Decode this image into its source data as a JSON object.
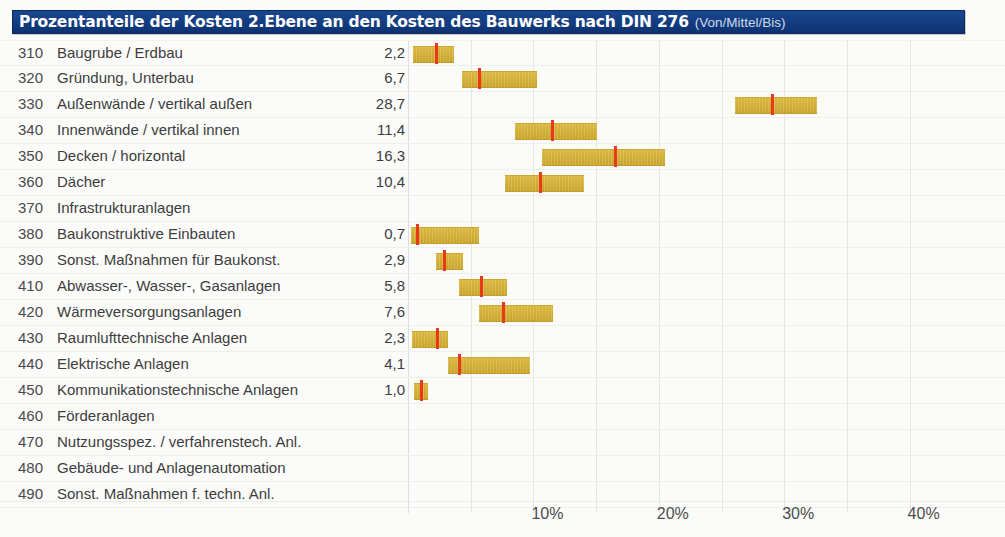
{
  "header": {
    "title_main": "Prozentanteile der Kosten 2.Ebene an den Kosten des Bauwerks nach DIN 276",
    "title_sub": "(Von/Mittel/Bis)"
  },
  "colors": {
    "header_bg": "#123c80",
    "bar": "#d2ae34",
    "marker": "#e8391b",
    "grid": "#e6e6e4"
  },
  "chart_data": {
    "type": "bar",
    "title": "Prozentanteile der Kosten 2.Ebene an den Kosten des Bauwerks nach DIN 276 (Von/Mittel/Bis)",
    "xlabel": "",
    "ylabel": "",
    "xlim": [
      0,
      42
    ],
    "grid": true,
    "legend": "none",
    "xticks": [
      "10%",
      "20%",
      "30%",
      "40%"
    ],
    "xtick_values": [
      10,
      20,
      30,
      40
    ],
    "value_format": "von / mittel / bis (Prozent)",
    "categories": [
      "310 Baugrube / Erdbau",
      "320 Gründung, Unterbau",
      "330 Außenwände / vertikal außen",
      "340 Innenwände / vertikal innen",
      "350 Decken / horizontal",
      "360 Dächer",
      "370 Infrastrukturanlagen",
      "380 Baukonstruktive Einbauten",
      "390 Sonst. Maßnahmen für Baukonst.",
      "410 Abwasser-, Wasser-, Gasanlagen",
      "420 Wärmeversorgungsanlagen",
      "430 Raumlufttechnische Anlagen",
      "440 Elektrische Anlagen",
      "450 Kommunikationstechnische Anlagen",
      "460 Förderanlagen",
      "470 Nutzungsspez. / verfahrenstech. Anl.",
      "480 Gebäude- und Anlagenautomation",
      "490 Sonst. Maßnahmen f. techn. Anl."
    ],
    "rows": [
      {
        "code": "310",
        "label": "Baugrube / Erdbau",
        "value": "2,2",
        "von": 0.4,
        "mittel": 2.2,
        "bis": 3.7
      },
      {
        "code": "320",
        "label": "Gründung, Unterbau",
        "value": "6,7",
        "von": 4.3,
        "mittel": 5.7,
        "bis": 10.3
      },
      {
        "code": "330",
        "label": "Außenwände / vertikal außen",
        "value": "28,7",
        "von": 26.1,
        "mittel": 29.0,
        "bis": 32.6
      },
      {
        "code": "340",
        "label": "Innenwände / vertikal innen",
        "value": "11,4",
        "von": 8.5,
        "mittel": 11.5,
        "bis": 15.1
      },
      {
        "code": "350",
        "label": "Decken / horizontal",
        "value": "16,3",
        "von": 10.7,
        "mittel": 16.5,
        "bis": 20.5
      },
      {
        "code": "360",
        "label": "Dächer",
        "value": "10,4",
        "von": 7.7,
        "mittel": 10.5,
        "bis": 14.0
      },
      {
        "code": "370",
        "label": "Infrastrukturanlagen",
        "value": "",
        "von": null,
        "mittel": null,
        "bis": null
      },
      {
        "code": "380",
        "label": "Baukonstruktive Einbauten",
        "value": "0,7",
        "von": 0.2,
        "mittel": 0.7,
        "bis": 5.7
      },
      {
        "code": "390",
        "label": "Sonst. Maßnahmen für Baukonst.",
        "value": "2,9",
        "von": 2.2,
        "mittel": 2.9,
        "bis": 4.4
      },
      {
        "code": "410",
        "label": "Abwasser-, Wasser-, Gasanlagen",
        "value": "5,8",
        "von": 4.1,
        "mittel": 5.8,
        "bis": 7.9
      },
      {
        "code": "420",
        "label": "Wärmeversorgungsanlagen",
        "value": "7,6",
        "von": 5.7,
        "mittel": 7.6,
        "bis": 11.6
      },
      {
        "code": "430",
        "label": "Raumlufttechnische Anlagen",
        "value": "2,3",
        "von": 0.3,
        "mittel": 2.3,
        "bis": 3.2
      },
      {
        "code": "440",
        "label": "Elektrische Anlagen",
        "value": "4,1",
        "von": 3.2,
        "mittel": 4.1,
        "bis": 9.7
      },
      {
        "code": "450",
        "label": "Kommunikationstechnische Anlagen",
        "value": "1,0",
        "von": 0.5,
        "mittel": 1.0,
        "bis": 1.6
      },
      {
        "code": "460",
        "label": "Förderanlagen",
        "value": "",
        "von": null,
        "mittel": null,
        "bis": null
      },
      {
        "code": "470",
        "label": "Nutzungsspez. / verfahrenstech. Anl.",
        "value": "",
        "von": null,
        "mittel": null,
        "bis": null
      },
      {
        "code": "480",
        "label": "Gebäude- und Anlagenautomation",
        "value": "",
        "von": null,
        "mittel": null,
        "bis": null
      },
      {
        "code": "490",
        "label": "Sonst. Maßnahmen f. techn. Anl.",
        "value": "",
        "von": null,
        "mittel": null,
        "bis": null
      }
    ]
  }
}
